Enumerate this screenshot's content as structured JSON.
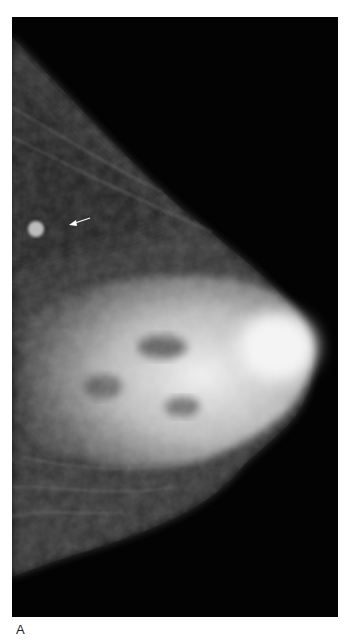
{
  "figure": {
    "type": "mammogram",
    "view": "mediolateral oblique",
    "panel_label": "A",
    "annotation": {
      "type": "arrow",
      "points_to": "small spiculated mass",
      "direction": "left"
    },
    "colors": {
      "background": "#030303",
      "page": "#ffffff"
    }
  }
}
